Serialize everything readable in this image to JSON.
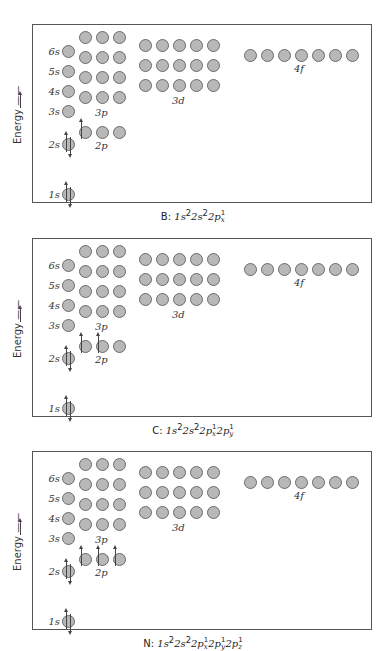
{
  "axis_label": "Energy",
  "orbital_labels": {
    "s": [
      "1s",
      "2s",
      "3s",
      "4s",
      "5s",
      "6s"
    ],
    "p": [
      "2p",
      "3p"
    ],
    "d": "3d",
    "f": "4f"
  },
  "panels": [
    {
      "element": "B",
      "caption": "B: 1s²2s²2pₓ¹",
      "caption_parts": {
        "symbol": "B:",
        "config": "1s²2s²2p",
        "sub": [
          "x"
        ],
        "sup": [
          "1"
        ]
      },
      "electrons": {
        "1s": 2,
        "2s": 2,
        "2p": [
          1,
          0,
          0
        ]
      }
    },
    {
      "element": "C",
      "caption": "C: 1s²2s²2pₓ¹2p_y¹",
      "caption_parts": {
        "symbol": "C:",
        "config": "1s²2s²2p",
        "sub": [
          "x",
          "y"
        ],
        "sup": [
          "1",
          "1"
        ]
      },
      "electrons": {
        "1s": 2,
        "2s": 2,
        "2p": [
          1,
          1,
          0
        ]
      }
    },
    {
      "element": "N",
      "caption": "N: 1s²2s²2pₓ¹2p_y¹2p_z¹",
      "caption_parts": {
        "symbol": "N:",
        "config": "1s²2s²2p",
        "sub": [
          "x",
          "y",
          "z"
        ],
        "sup": [
          "1",
          "1",
          "1"
        ]
      },
      "electrons": {
        "1s": 2,
        "2s": 2,
        "2p": [
          1,
          1,
          1
        ]
      }
    }
  ]
}
